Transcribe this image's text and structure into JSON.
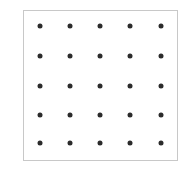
{
  "diagram": {
    "type": "dot-grid",
    "rows": 5,
    "columns": 5,
    "dot_color": "#2b2b2b",
    "border_color": "#c8c8c8",
    "dot_x": [
      40,
      70,
      100,
      130,
      161
    ],
    "dot_y": [
      26,
      56,
      86,
      115,
      143
    ]
  }
}
